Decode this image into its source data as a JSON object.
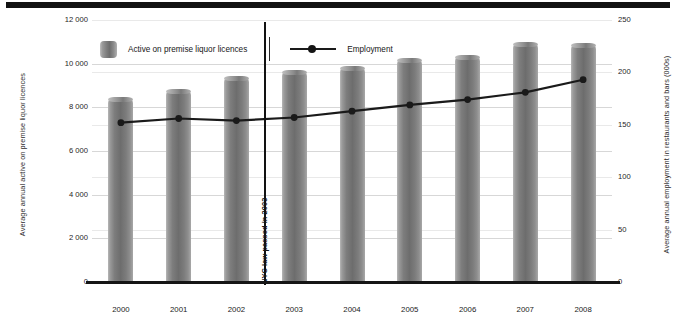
{
  "chart_data": {
    "type": "bar",
    "title": "",
    "subtitle": "",
    "xlabel": "",
    "ylabel": "Average annual active on premise liquor licences",
    "y2label": "Average annual employment in restaurants and bars (000s)",
    "categories": [
      "2000",
      "2001",
      "2002",
      "2003",
      "2004",
      "2005",
      "2006",
      "2007",
      "2008"
    ],
    "ylim": [
      0,
      12000
    ],
    "y2lim": [
      0,
      250
    ],
    "yticks": [
      "0",
      "2 000",
      "4 000",
      "6 000",
      "8 000",
      "10 000",
      "12 000"
    ],
    "ytick_values": [
      0,
      2000,
      4000,
      6000,
      8000,
      10000,
      12000
    ],
    "y2ticks": [
      "0",
      "50",
      "100",
      "150",
      "200",
      "250"
    ],
    "y2tick_values": [
      0,
      50,
      100,
      150,
      200,
      250
    ],
    "grid": true,
    "legend_position": "top-center",
    "series": [
      {
        "name": "Active on premise liquor licences",
        "type": "bar",
        "axis": "left",
        "color": "#7a7a7a",
        "values": [
          8450,
          8800,
          9400,
          9650,
          9850,
          10200,
          10350,
          10950,
          10900
        ]
      },
      {
        "name": "Employment",
        "type": "line",
        "axis": "right",
        "color": "#1a1a1a",
        "values": [
          152,
          156,
          154,
          157,
          163,
          169,
          174,
          181,
          193
        ]
      }
    ],
    "annotations": [
      {
        "name": "nyc-law-event",
        "label": "NYC law passed in 2003",
        "type": "vertical-line",
        "x_between": [
          "2002",
          "2003"
        ]
      }
    ]
  },
  "legend": {
    "bar_label": "Active on premise liquor licences",
    "line_label": "Employment"
  }
}
